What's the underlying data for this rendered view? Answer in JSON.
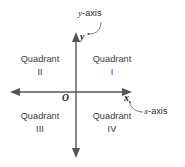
{
  "diagram": {
    "colors": {
      "axis": "#555555",
      "text": "#2b2b2b",
      "background": "#ffffff",
      "leader": "#6b6b6b"
    },
    "axes": {
      "y_variable": "y",
      "x_variable": "x",
      "origin": "O"
    },
    "callouts": {
      "y_axis": {
        "prefix": "y",
        "suffix": "-axis"
      },
      "x_axis": {
        "prefix": "x",
        "suffix": "-axis"
      }
    },
    "quadrants": [
      {
        "id": "I",
        "word": "Quadrant",
        "numeral": "I"
      },
      {
        "id": "II",
        "word": "Quadrant",
        "numeral": "II"
      },
      {
        "id": "III",
        "word": "Quadrant",
        "numeral": "III"
      },
      {
        "id": "IV",
        "word": "Quadrant",
        "numeral": "IV"
      }
    ]
  }
}
